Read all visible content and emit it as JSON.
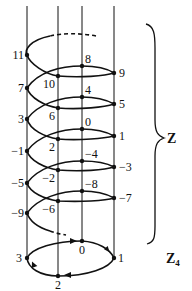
{
  "diagram": {
    "type": "helix-covering-map",
    "colors": {
      "ink": "#111111",
      "background": "#ffffff"
    },
    "helix_label": "Z",
    "circle_label_main": "Z",
    "circle_label_sub": "4",
    "helix_points": [
      {
        "value": "11",
        "label": "11"
      },
      {
        "value": "10",
        "label": "10"
      },
      {
        "value": "9",
        "label": "9"
      },
      {
        "value": "8",
        "label": "8"
      },
      {
        "value": "7",
        "label": "7"
      },
      {
        "value": "6",
        "label": "6"
      },
      {
        "value": "5",
        "label": "5"
      },
      {
        "value": "4",
        "label": "4"
      },
      {
        "value": "3",
        "label": "3"
      },
      {
        "value": "2",
        "label": "2"
      },
      {
        "value": "1",
        "label": "1"
      },
      {
        "value": "0",
        "label": "0"
      },
      {
        "value": "-1",
        "label": "−1"
      },
      {
        "value": "-2",
        "label": "−2"
      },
      {
        "value": "-3",
        "label": "−3"
      },
      {
        "value": "-4",
        "label": "−4"
      },
      {
        "value": "-5",
        "label": "−5"
      },
      {
        "value": "-6",
        "label": "−6"
      },
      {
        "value": "-7",
        "label": "−7"
      },
      {
        "value": "-8",
        "label": "−8"
      },
      {
        "value": "-9",
        "label": "−9"
      }
    ],
    "circle_points": [
      {
        "value": "0",
        "label": "0"
      },
      {
        "value": "1",
        "label": "1"
      },
      {
        "value": "2",
        "label": "2"
      },
      {
        "value": "3",
        "label": "3"
      }
    ]
  }
}
